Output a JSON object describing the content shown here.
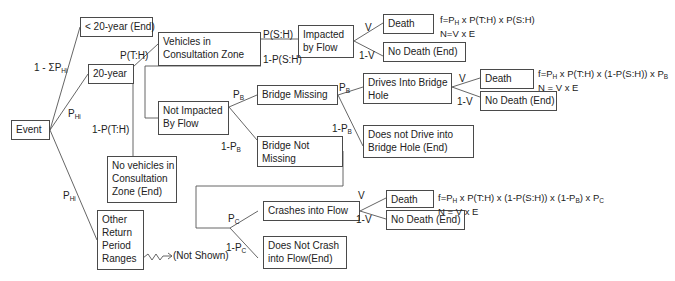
{
  "diagram": {
    "type": "event-tree",
    "nodes": {
      "event": "Event",
      "lt20": "< 20-year (End)",
      "y20": "20-year",
      "vehicles": [
        "Vehicles in",
        "Consultation Zone"
      ],
      "novehicles": [
        "No vehicles in",
        "Consultation",
        "Zone (End)"
      ],
      "other": [
        "Other",
        "Return",
        "Period",
        "Ranges"
      ],
      "notshown": "(Not Shown)",
      "impacted": [
        "Impacted",
        "by Flow"
      ],
      "notimpacted": [
        "Not Impacted",
        "By Flow"
      ],
      "death1": "Death",
      "nodeath1": "No Death (End)",
      "bridgemissing": "Bridge Missing",
      "bridgenotmissing": [
        "Bridge Not",
        "Missing"
      ],
      "drives": [
        "Drives Into Bridge",
        "Hole"
      ],
      "notdrive": [
        "Does not Drive into",
        "Bridge Hole (End)"
      ],
      "death2": "Death",
      "nodeath2": "No Death (End)",
      "crashes": "Crashes into Flow",
      "notcrash": [
        "Does Not Crash",
        "into Flow(End)"
      ],
      "death3": "Death",
      "nodeath3": "No Death (End)"
    },
    "edges": {
      "one_minus_sum": "1 - ΣP",
      "one_minus_sum_sub": "Hi",
      "phi1": "P",
      "phi1_sub": "Hi",
      "phi2": "P",
      "phi2_sub": "Hi",
      "pth": "P(T:H)",
      "one_minus_pth": "1-P(T:H)",
      "psh": "P(S:H)",
      "one_minus_psh": "1-P(S:H)",
      "v1": "V",
      "one_minus_v1": "1-V",
      "pb1": "P",
      "pb1_sub": "B",
      "one_minus_pb1": "1-P",
      "one_minus_pb1_sub": "B",
      "pb2": "P",
      "pb2_sub": "B",
      "one_minus_pb2": "1-P",
      "one_minus_pb2_sub": "B",
      "v2": "V",
      "one_minus_v2": "1-V",
      "pc": "P",
      "pc_sub": "C",
      "one_minus_pc": "1-P",
      "one_minus_pc_sub": "C",
      "v3": "V",
      "one_minus_v3": "1-V"
    },
    "formulas": {
      "f1a": "f=P",
      "f1a_sub": "H",
      "f1b": " x P(T:H) x P(S:H)",
      "n1": "N=V x E",
      "f2a": "f=P",
      "f2a_sub": "H",
      "f2b": " x P(T:H) x (1-P(S:H)) x P",
      "f2b_sub": "B",
      "n2": "N = V x E",
      "f3a": "f=P",
      "f3a_sub": "H",
      "f3b": " x P(T:H) x (1-P(S:H)) x (1-P",
      "f3b_sub": "B",
      "f3c": ") x P",
      "f3c_sub": "C",
      "n3": "N = V x E"
    }
  }
}
